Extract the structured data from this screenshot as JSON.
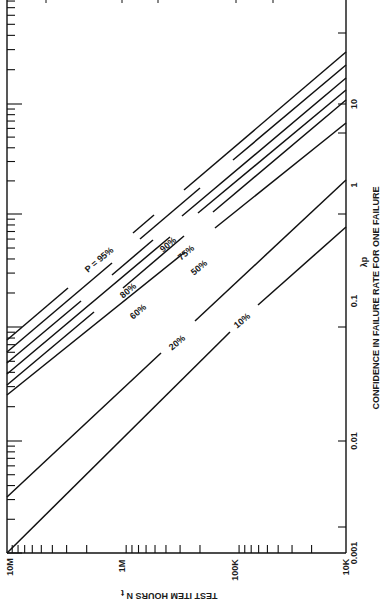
{
  "chart_data": {
    "type": "line",
    "title": "",
    "orientation": "rotated 90° clockwise (page rotated); N axis runs along bottom, λp axis along right side",
    "xlabel": "TEST ITEM HOURS N t",
    "ylabel": "CONFIDENCE IN FAILURE RATE FOR ONE FAILURE",
    "ylabel_symbol": "λp",
    "x_scale": "log",
    "y_scale": "log",
    "x_ticks": [
      "10M",
      "1M",
      "100K",
      "10K"
    ],
    "x_tick_values": [
      10000000,
      1000000,
      100000,
      10000
    ],
    "y_ticks": [
      "0.001",
      "0.01",
      "0.1",
      "1",
      "10"
    ],
    "y_tick_values": [
      0.001,
      0.01,
      0.1,
      1,
      10
    ],
    "xlim": [
      10000000,
      10000
    ],
    "ylim": [
      0.001,
      100
    ],
    "grid": false,
    "legend": "inline labels on lines",
    "series": [
      {
        "name": "P = 95%",
        "label": "P = 95%",
        "x": [
          10000000,
          10000
        ],
        "y": [
          0.03,
          29.96
        ]
      },
      {
        "name": "90%",
        "label": "90%",
        "x": [
          10000000,
          10000
        ],
        "y": [
          0.023,
          23.0
        ]
      },
      {
        "name": "80%",
        "label": "80%",
        "x": [
          10000000,
          10000
        ],
        "y": [
          0.0161,
          16.1
        ]
      },
      {
        "name": "75%",
        "label": "75%",
        "x": [
          10000000,
          10000
        ],
        "y": [
          0.0139,
          13.9
        ]
      },
      {
        "name": "60%",
        "label": "60%",
        "x": [
          10000000,
          10000
        ],
        "y": [
          0.0092,
          9.2
        ]
      },
      {
        "name": "50%",
        "label": "50%",
        "x": [
          10000000,
          10000
        ],
        "y": [
          0.0069,
          6.9
        ]
      },
      {
        "name": "20%",
        "label": "20%",
        "x": [
          10000000,
          10000
        ],
        "y": [
          0.0022,
          2.2
        ]
      },
      {
        "name": "10%",
        "label": "10%",
        "x": [
          10000000,
          10000
        ],
        "y": [
          0.00105,
          1.05
        ]
      }
    ]
  },
  "axes": {
    "bottom": {
      "title": "TEST ITEM HOURS N",
      "title_subscript": "t",
      "ticks": [
        {
          "label": "10M",
          "x": 7
        },
        {
          "label": "1M",
          "x": 121
        },
        {
          "label": "100K",
          "x": 234
        },
        {
          "label": "10K",
          "x": 345
        }
      ]
    },
    "right": {
      "symbol": "λp",
      "title": "CONFIDENCE IN FAILURE RATE FOR ONE FAILURE",
      "ticks": [
        {
          "label": "0.001",
          "y": 553
        },
        {
          "label": "0.01",
          "y": 441
        },
        {
          "label": "0.1",
          "y": 327
        },
        {
          "label": "1",
          "y": 214
        },
        {
          "label": "10",
          "y": 104
        }
      ]
    }
  },
  "colors": {
    "line": "#111111",
    "background": "#ffffff",
    "text": "#1a1a1a"
  }
}
